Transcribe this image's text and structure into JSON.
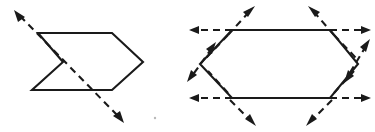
{
  "figure": {
    "background_color": "#ffffff",
    "ink_color": "#1a1a1a",
    "caption": "",
    "panels": [
      {
        "name": "left-panel",
        "label": "concave arrow-head polygon with single dashed axis of symmetry",
        "shape": {
          "name": "arrow-head-polygon",
          "type": "closed-polyline",
          "stroke": "solid",
          "vertices": [
            [
              38,
              33
            ],
            [
              112,
              33
            ],
            [
              143,
              62
            ],
            [
              112,
              90
            ],
            [
              32,
              90
            ],
            [
              63,
              62
            ]
          ]
        },
        "dashed_lines": [
          {
            "name": "diagonal-dashed-axis",
            "from": [
              16,
              12
            ],
            "to": [
              122,
              121
            ],
            "dash_pattern": "7 5",
            "arrowheads": [
              "start",
              "end"
            ]
          }
        ]
      },
      {
        "name": "right-panel",
        "label": "hexagon with six dashed axes through its vertices",
        "shape": {
          "name": "hexagon",
          "type": "closed-polygon",
          "stroke": "solid",
          "vertices": [
            [
              232,
              30
            ],
            [
              330,
              30
            ],
            [
              358,
              64
            ],
            [
              330,
              98
            ],
            [
              232,
              98
            ],
            [
              200,
              64
            ]
          ]
        },
        "dashed_lines": [
          {
            "name": "top-left-horizontal-dashed-arrow",
            "from": [
              232,
              30
            ],
            "to": [
              192,
              30
            ],
            "dash_pattern": "7 5",
            "arrowheads": [
              "end"
            ]
          },
          {
            "name": "top-left-diagonal-dashed-arrow",
            "from": [
              232,
              30
            ],
            "to": [
              253,
              8
            ],
            "dash_pattern": "7 5",
            "arrowheads": [
              "end"
            ]
          },
          {
            "name": "top-left-down-left-dashed-arrow",
            "from": [
              232,
              30
            ],
            "to": [
              212,
              52
            ],
            "dash_pattern": "7 5",
            "arrowheads": [
              "none"
            ]
          },
          {
            "name": "top-right-horizontal-dashed-arrow",
            "from": [
              330,
              30
            ],
            "to": [
              370,
              30
            ],
            "dash_pattern": "7 5",
            "arrowheads": [
              "end"
            ]
          },
          {
            "name": "top-right-diagonal-dashed-arrow",
            "from": [
              330,
              30
            ],
            "to": [
              310,
              8
            ],
            "dash_pattern": "7 5",
            "arrowheads": [
              "end"
            ]
          },
          {
            "name": "bottom-left-horizontal-dashed-arrow",
            "from": [
              232,
              98
            ],
            "to": [
              192,
              98
            ],
            "dash_pattern": "7 5",
            "arrowheads": [
              "end"
            ]
          },
          {
            "name": "bottom-left-diagonal-dashed-arrow",
            "from": [
              232,
              98
            ],
            "to": [
              253,
              122
            ],
            "dash_pattern": "7 5",
            "arrowheads": [
              "end"
            ]
          },
          {
            "name": "bottom-right-horizontal-dashed-arrow",
            "from": [
              330,
              98
            ],
            "to": [
              370,
              98
            ],
            "dash_pattern": "7 5",
            "arrowheads": [
              "end"
            ]
          },
          {
            "name": "bottom-right-diagonal-dashed-arrow",
            "from": [
              330,
              98
            ],
            "to": [
              308,
              122
            ],
            "dash_pattern": "7 5",
            "arrowheads": [
              "end"
            ]
          },
          {
            "name": "left-vertex-dashed-arrow",
            "from": [
              214,
              50
            ],
            "to": [
              188,
              80
            ],
            "dash_pattern": "7 5",
            "arrowheads": [
              "start",
              "end"
            ]
          },
          {
            "name": "right-vertex-dashed-arrow",
            "from": [
              369,
              44
            ],
            "to": [
              344,
              82
            ],
            "dash_pattern": "7 5",
            "arrowheads": [
              "start",
              "end"
            ]
          },
          {
            "name": "right-vertex-lower-diagonal-dashed-arrow",
            "from": [
              330,
              98
            ],
            "to": [
              352,
              74
            ],
            "dash_pattern": "7 5",
            "arrowheads": [
              "end"
            ]
          },
          {
            "name": "top-right-lower-diagonal-dashed-arrow",
            "from": [
              330,
              30
            ],
            "to": [
              352,
              54
            ],
            "dash_pattern": "7 5",
            "arrowheads": [
              "none"
            ]
          },
          {
            "name": "bottom-left-upper-diagonal-dashed-arrow",
            "from": [
              232,
              98
            ],
            "to": [
              210,
              74
            ],
            "dash_pattern": "7 5",
            "arrowheads": [
              "none"
            ]
          }
        ]
      }
    ],
    "artifacts": [
      {
        "name": "scan-speck",
        "position": [
          155,
          118
        ],
        "radius": 1.2
      }
    ]
  }
}
